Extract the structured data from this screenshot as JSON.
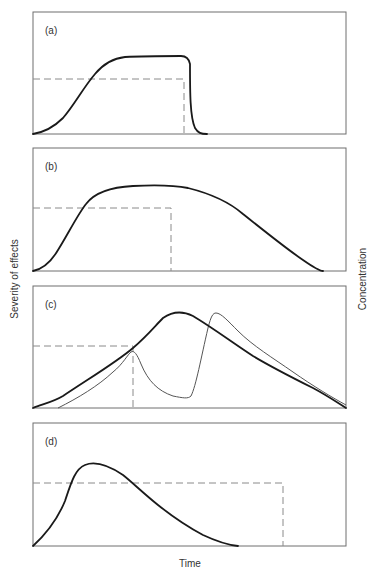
{
  "figure": {
    "x_axis_label": "Time",
    "y_axis_left_label": "Severity of effects",
    "y_axis_right_label": "Concentration"
  },
  "panels": [
    {
      "label": "(a)",
      "frame": {
        "x": 33,
        "y": 12,
        "w": 313,
        "h": 122
      },
      "severity_curve": "M0,122 C12,120 22,114 30,106 C42,92 50,76 62,62 C72,50 82,46 92,45 C110,44 130,44 148,44 C154,44 156,47 157,52 C157,80 157,105 162,116 C165,121 168,122 174,122",
      "concentration_dashed": "M0,67 L151,67 L151,122"
    },
    {
      "label": "(b)",
      "frame": {
        "x": 33,
        "y": 148,
        "w": 313,
        "h": 123
      },
      "severity_curve": "M0,123 C10,121 18,114 25,102 C35,86 45,66 53,56 C62,44 80,39 100,38 C120,37 140,37 155,40 C175,45 195,53 210,66 C230,82 255,102 270,112 C280,119 287,123 290,123",
      "concentration_dashed": "M0,60 L138,60 L138,123"
    },
    {
      "label": "(c)",
      "frame": {
        "x": 33,
        "y": 286,
        "w": 313,
        "h": 122
      },
      "severity_curve": "M0,122 C10,118 20,116 30,110 C60,90 85,75 100,62 C115,49 122,40 130,32 C140,25 150,25 160,30 C180,42 200,57 220,70 C240,82 260,92 280,102 C295,110 305,117 313,122",
      "concentration_curve": "M25,122 C45,112 65,100 80,86 C90,78 95,68 98,66 C101,64 104,68 108,78 C115,95 125,105 140,110 C150,112 155,113 158,110 C163,100 168,72 175,42 C178,30 180,27 183,27 C188,27 195,35 205,45 C220,60 240,72 260,86 C280,100 300,112 313,119",
      "concentration_dashed": "M0,60 L100,60 L100,122"
    },
    {
      "label": "(d)",
      "frame": {
        "x": 33,
        "y": 423,
        "w": 313,
        "h": 123
      },
      "severity_curve": "M0,123 C12,112 25,95 32,78 C38,60 42,46 52,42 C62,38 75,42 90,52 C100,60 110,70 125,82 C140,94 155,104 170,112 C185,119 195,122 205,123",
      "concentration_dashed": "M0,60 L250,60 L250,123"
    }
  ]
}
